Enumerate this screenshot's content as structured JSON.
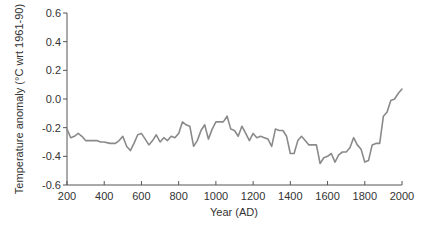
{
  "chart_data": {
    "type": "line",
    "title": "",
    "xlabel": "Year (AD)",
    "ylabel": "Temperature anomaly (°C wrt 1961-90)",
    "xlim": [
      200,
      2000
    ],
    "ylim": [
      -0.6,
      0.6
    ],
    "grid": false,
    "legend": null,
    "x_ticks": [
      200,
      400,
      600,
      800,
      1000,
      1200,
      1400,
      1600,
      1800,
      2000
    ],
    "y_ticks": [
      0.6,
      0.4,
      0.2,
      0.0,
      -0.2,
      -0.4,
      -0.6
    ],
    "y_tick_labels": [
      "0.6",
      "0.4",
      "0.2",
      "0.0",
      "-0.2",
      "-0.4",
      "-0.6"
    ],
    "series": [
      {
        "name": "Temperature anomaly",
        "color": "#8a8a8a",
        "x": [
          200,
          220,
          240,
          260,
          280,
          300,
          330,
          360,
          380,
          400,
          430,
          460,
          480,
          500,
          520,
          540,
          560,
          580,
          600,
          620,
          640,
          660,
          680,
          700,
          720,
          740,
          760,
          780,
          800,
          820,
          840,
          860,
          880,
          900,
          920,
          940,
          960,
          980,
          1000,
          1020,
          1040,
          1060,
          1080,
          1100,
          1120,
          1140,
          1160,
          1180,
          1200,
          1220,
          1240,
          1260,
          1280,
          1300,
          1320,
          1340,
          1360,
          1380,
          1400,
          1420,
          1440,
          1460,
          1480,
          1500,
          1520,
          1540,
          1560,
          1580,
          1600,
          1620,
          1640,
          1660,
          1680,
          1700,
          1720,
          1740,
          1760,
          1780,
          1800,
          1820,
          1840,
          1860,
          1880,
          1900,
          1920,
          1940,
          1960,
          1980,
          2000
        ],
        "values": [
          -0.21,
          -0.27,
          -0.26,
          -0.24,
          -0.26,
          -0.29,
          -0.29,
          -0.29,
          -0.3,
          -0.3,
          -0.31,
          -0.31,
          -0.29,
          -0.26,
          -0.33,
          -0.36,
          -0.31,
          -0.25,
          -0.24,
          -0.28,
          -0.32,
          -0.29,
          -0.25,
          -0.3,
          -0.27,
          -0.29,
          -0.26,
          -0.27,
          -0.24,
          -0.16,
          -0.18,
          -0.19,
          -0.33,
          -0.29,
          -0.22,
          -0.18,
          -0.28,
          -0.21,
          -0.16,
          -0.16,
          -0.16,
          -0.12,
          -0.21,
          -0.22,
          -0.26,
          -0.19,
          -0.24,
          -0.29,
          -0.24,
          -0.27,
          -0.26,
          -0.27,
          -0.28,
          -0.33,
          -0.21,
          -0.22,
          -0.22,
          -0.26,
          -0.38,
          -0.38,
          -0.29,
          -0.26,
          -0.29,
          -0.32,
          -0.32,
          -0.32,
          -0.45,
          -0.41,
          -0.4,
          -0.38,
          -0.44,
          -0.39,
          -0.37,
          -0.37,
          -0.34,
          -0.27,
          -0.32,
          -0.35,
          -0.44,
          -0.43,
          -0.32,
          -0.31,
          -0.31,
          -0.12,
          -0.09,
          -0.01,
          0.0,
          0.04,
          0.07
        ]
      }
    ]
  }
}
